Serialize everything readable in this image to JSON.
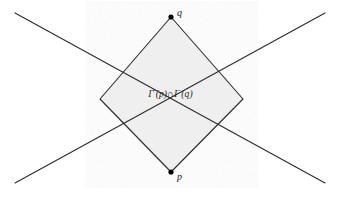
{
  "figure": {
    "kind": "spacetime-causal-diamond",
    "canvas": {
      "width": 341,
      "height": 197
    },
    "background_color": "#ffffff",
    "line_color": "#2b2b2b",
    "region_fill_color": "#f2f2f2",
    "region_stroke_color": "#2b2b2b",
    "point_color": "#000000"
  },
  "region": {
    "label_full": "I+(p)∩I−(q)",
    "label_parts": {
      "first_set_letter": "I",
      "first_set_superscript": "+",
      "first_set_argument": "(p)",
      "operator": "∩",
      "second_set_letter": "I",
      "second_set_superscript": "−",
      "second_set_argument": "(q)"
    },
    "vertices": {
      "top": {
        "x": 171,
        "y": 17
      },
      "left": {
        "x": 100,
        "y": 99
      },
      "bottom": {
        "x": 171,
        "y": 172
      },
      "right": {
        "x": 243,
        "y": 99
      }
    }
  },
  "points": [
    {
      "id": "q",
      "label": "q",
      "x": 171,
      "y": 17,
      "label_x": 177,
      "label_y": 8
    },
    {
      "id": "p",
      "label": "p",
      "x": 171,
      "y": 172,
      "label_x": 177,
      "label_y": 172
    }
  ],
  "light_cone_lines": [
    {
      "id": "line-nw-se",
      "x1": 15,
      "y1": 13,
      "x2": 325,
      "y2": 183
    },
    {
      "id": "line-ne-sw",
      "x1": 325,
      "y1": 13,
      "x2": 15,
      "y2": 183
    }
  ]
}
